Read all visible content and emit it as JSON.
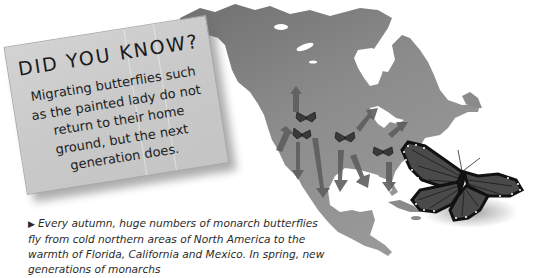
{
  "did_you_know": {
    "title": "DID YOU KNOW?",
    "body": "Migrating butterflies such as the painted lady do not return to their home ground, but the next generation does."
  },
  "caption": {
    "bullet_icon": "right-triangle-bullet",
    "text": "Every autumn, huge numbers of monarch butterflies fly from cold northern areas of North America to the warmth of Florida, California and Mexico. In spring, new generations of monarchs"
  },
  "illustration": {
    "subject": "North America migration map",
    "small_butterflies": 4,
    "large_butterfly": "monarch",
    "colors": {
      "land": "#8a8a8a",
      "land_dark": "#6e6e6e",
      "water": "#ffffff",
      "arrow": "#5a5a5a",
      "butterfly_wing": "#4a4a4a",
      "butterfly_edge": "#111111",
      "card": "#cccccc"
    }
  }
}
